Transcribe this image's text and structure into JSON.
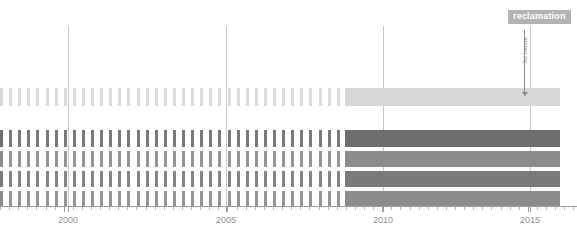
{
  "badge": {
    "label": "reclamation",
    "color": "#b3b3b3",
    "text_color": "#ffffff",
    "x": 508,
    "y": 10,
    "width": 60,
    "height": 13
  },
  "annotation": {
    "label": "Sd Inesta",
    "color": "#8a8a8a",
    "x": 524,
    "y_top": 30,
    "y_bottom": 96
  },
  "axis": {
    "labels": [
      "2000",
      "2005",
      "2010",
      "2015"
    ],
    "label_x": [
      68,
      226,
      383,
      530
    ],
    "label_y": 215,
    "line_y": 206,
    "line_x0": 0,
    "line_x1": 577,
    "tick_color": "#9e9e9e",
    "label_color": "#8f8f8f",
    "major_tick_x": [
      68,
      226,
      383,
      530
    ],
    "minor_tick_spacing": 9.1
  },
  "gridlines": {
    "color": "#c9c9c9",
    "x": [
      68,
      226,
      383,
      530
    ],
    "y_top": 26,
    "y_bottom": 206
  },
  "plot": {
    "x0": 0,
    "x1": 560,
    "solid_start_x": 345,
    "tick_width": 3,
    "tick_gap": 9.1
  },
  "chart_data": {
    "type": "bar",
    "title": "",
    "subtitle": "",
    "xlabel": "",
    "ylabel": "",
    "grid": true,
    "legend_position": "top-right",
    "xlim": [
      1997.0,
      2016.5
    ],
    "x_ticks": [
      2000,
      2005,
      2010,
      2015
    ],
    "annotations": [
      {
        "text": "reclamation",
        "type": "badge",
        "x": 2016.0
      },
      {
        "text": "Sd Inesta",
        "type": "pointer",
        "x": 2015.0
      }
    ],
    "series": [
      {
        "name": "row-1",
        "color": "#d8d8d8",
        "y_top": 88,
        "height": 18,
        "sparse_until_x": 345,
        "solid_from_x": 345,
        "solid_to_x": 560
      },
      {
        "name": "row-2",
        "color": "#6e6e6e",
        "y_top": 130,
        "height": 17,
        "sparse_until_x": 345,
        "solid_from_x": 345,
        "solid_to_x": 560
      },
      {
        "name": "row-3",
        "color": "#8c8c8c",
        "y_top": 151,
        "height": 16,
        "sparse_until_x": 345,
        "solid_from_x": 345,
        "solid_to_x": 560
      },
      {
        "name": "row-4",
        "color": "#7a7a7a",
        "y_top": 171,
        "height": 16,
        "sparse_until_x": 345,
        "solid_from_x": 345,
        "solid_to_x": 560
      },
      {
        "name": "row-5",
        "color": "#8c8c8c",
        "y_top": 191,
        "height": 15,
        "sparse_until_x": 345,
        "solid_from_x": 345,
        "solid_to_x": 560
      }
    ]
  }
}
